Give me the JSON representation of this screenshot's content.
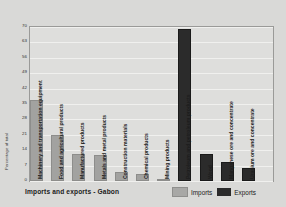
{
  "chart_data": {
    "type": "bar",
    "title": "Imports and exports - Gabon",
    "xlabel": "",
    "ylabel": "Percentage of total",
    "ylim": [
      0,
      70
    ],
    "yticks": [
      70,
      63,
      56,
      49,
      42,
      35,
      28,
      21,
      14,
      7,
      0
    ],
    "grid": true,
    "legend_position": "bottom-right",
    "legend": [
      "Imports",
      "Exports"
    ],
    "colors": {
      "imports": "#a2a2a0",
      "exports": "#2b2b2b",
      "background": "#d9d9d7",
      "plot_background": "#dededc"
    },
    "categories": [
      "Machinery and transportation equipment",
      "Food and agricultural products",
      "Manufactured products",
      "Metals and metal products",
      "Construction materials",
      "Chemical products",
      "Mining products",
      "Petroleum and petroleum products",
      "Wood",
      "Manganese ore and concentrate",
      "Uranium ore and concentrate"
    ],
    "bars": [
      {
        "label": "Machinery and transportation equipment",
        "value": 37,
        "series": "Imports"
      },
      {
        "label": "Food and agricultural products",
        "value": 21,
        "series": "Imports"
      },
      {
        "label": "Manufactured products",
        "value": 12.5,
        "series": "Imports"
      },
      {
        "label": "Metals and metal products",
        "value": 12,
        "series": "Imports"
      },
      {
        "label": "Construction materials",
        "value": 4,
        "series": "Imports"
      },
      {
        "label": "Chemical products",
        "value": 3,
        "series": "Imports"
      },
      {
        "label": "Mining products",
        "value": 1,
        "series": "Imports"
      },
      {
        "label": "Petroleum and petroleum products",
        "value": 69,
        "series": "Exports"
      },
      {
        "label": "Wood",
        "value": 12.5,
        "series": "Exports"
      },
      {
        "label": "Manganese ore and concentrate",
        "value": 8.5,
        "series": "Exports"
      },
      {
        "label": "Uranium ore and concentrate",
        "value": 6,
        "series": "Exports"
      }
    ]
  }
}
